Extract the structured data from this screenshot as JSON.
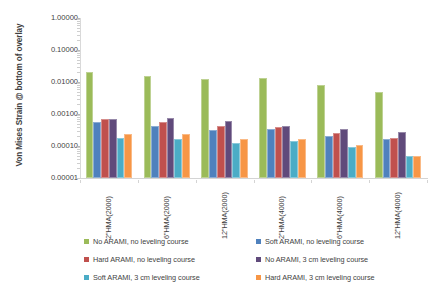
{
  "chart_data": {
    "type": "bar",
    "title": "",
    "xlabel": "",
    "ylabel": "Von Mises Strain @ bottom of overlay",
    "yscale": "log",
    "ylim": [
      1e-05,
      1.0
    ],
    "ytick_labels": [
      "1.00000",
      "0.10000",
      "0.01000",
      "0.00100",
      "0.00010",
      "0.00001"
    ],
    "ytick_values": [
      1.0,
      0.1,
      0.01,
      0.001,
      0.0001,
      1e-05
    ],
    "grid": false,
    "legend_position": "bottom",
    "categories": [
      "2\"HMA(2000)",
      "6\"HMA(2000)",
      "12\"HMA(2000)",
      "2\"HMA(4000)",
      "6\"HMA(4000)",
      "12\"HMA(4000)"
    ],
    "series": [
      {
        "name": "No ARAMI, no leveling course",
        "color": "#9BBB59",
        "values": [
          0.02,
          0.015,
          0.012,
          0.013,
          0.008,
          0.005
        ]
      },
      {
        "name": "Soft ARAMI, no leveling course",
        "color": "#4F81BD",
        "values": [
          0.00055,
          0.00042,
          0.00032,
          0.00035,
          0.00021,
          0.00017
        ]
      },
      {
        "name": "Hard ARAMI, no leveling course",
        "color": "#C0504D",
        "values": [
          0.00068,
          0.00055,
          0.00042,
          0.0004,
          0.00026,
          0.00018
        ]
      },
      {
        "name": "No ARAMI, 3 cm leveling course",
        "color": "#604A7B",
        "values": [
          0.00072,
          0.00075,
          0.0006,
          0.00042,
          0.00034,
          0.00028
        ]
      },
      {
        "name": "Soft ARAMI, 3 cm leveling course",
        "color": "#4BACC6",
        "values": [
          0.00018,
          0.00017,
          0.00012,
          0.00014,
          9e-05,
          5e-05
        ]
      },
      {
        "name": "Hard ARAMI, 3 cm leveling course",
        "color": "#F79646",
        "values": [
          0.00023,
          0.00024,
          0.00017,
          0.00016,
          0.00011,
          5e-05
        ]
      }
    ]
  }
}
